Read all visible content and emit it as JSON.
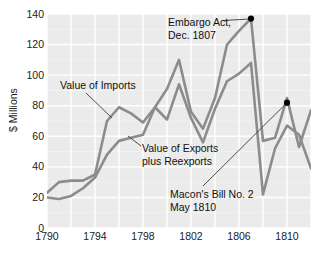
{
  "chart_data": {
    "type": "line",
    "title": "",
    "xlabel": "",
    "ylabel": "$ Millions",
    "xlim": [
      1790,
      1812
    ],
    "ylim": [
      0,
      140
    ],
    "grid": true,
    "legend": "none (inline annotations)",
    "x_ticks": [
      "1790",
      "1794",
      "1798",
      "1802",
      "1806",
      "1810"
    ],
    "x_tick_values": [
      1790,
      1794,
      1798,
      1802,
      1806,
      1810
    ],
    "y_ticks": [
      "0",
      "20",
      "40",
      "60",
      "80",
      "100",
      "120",
      "140"
    ],
    "y_tick_values": [
      0,
      20,
      40,
      60,
      80,
      100,
      120,
      140
    ],
    "x": [
      1790,
      1791,
      1792,
      1793,
      1794,
      1795,
      1796,
      1797,
      1798,
      1799,
      1800,
      1801,
      1802,
      1803,
      1804,
      1805,
      1806,
      1807,
      1808,
      1809,
      1810,
      1811,
      1812
    ],
    "series": [
      {
        "name": "Value of Imports",
        "color": "#8c8c8c",
        "values": [
          23,
          30,
          31,
          31,
          35,
          70,
          79,
          75,
          69,
          79,
          91,
          110,
          76,
          65,
          85,
          120,
          129,
          137,
          57,
          59,
          85,
          53,
          77
        ]
      },
      {
        "name": "Value of Exports plus Reexports",
        "color": "#8c8c8c",
        "values": [
          20,
          19,
          21,
          26,
          33,
          48,
          57,
          59,
          61,
          79,
          71,
          94,
          72,
          56,
          78,
          96,
          101,
          108,
          22,
          52,
          67,
          61,
          39
        ]
      }
    ],
    "markers": [
      {
        "name": "embargo-act-marker",
        "x": 1807,
        "y": 137,
        "color": "#000000"
      },
      {
        "name": "macons-bill-marker",
        "x": 1810,
        "y": 82,
        "color": "#000000"
      }
    ],
    "annotations": [
      {
        "name": "embargo-act",
        "line1": "Embargo Act,",
        "line2": "Dec. 1807"
      },
      {
        "name": "value-of-imports",
        "line1": "Value of Imports",
        "line2": ""
      },
      {
        "name": "value-of-exports",
        "line1": "Value of Exports",
        "line2": "plus Reexports"
      },
      {
        "name": "macons-bill",
        "line1": "Macon's Bill No. 2",
        "line2": "May 1810"
      }
    ]
  },
  "style": {
    "panel_bg": "#ebebeb",
    "grid_color": "#ffffff",
    "page_bg": "#ffffff",
    "line_color": "#8c8c8c",
    "marker_color": "#000000",
    "leader_color": "#4d4d4d",
    "text_color": "#111111"
  },
  "axes": {
    "y_axis_label": "$ Millions"
  }
}
